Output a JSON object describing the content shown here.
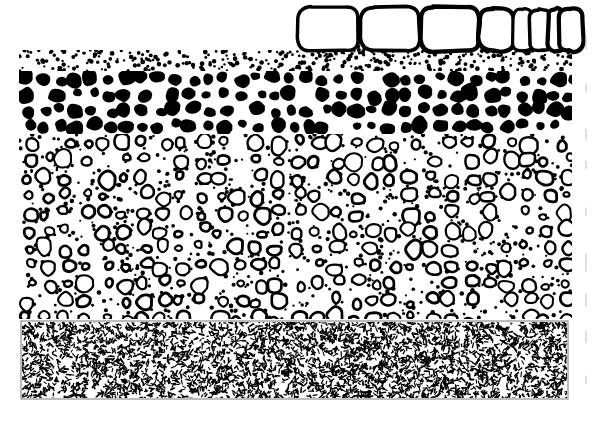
{
  "figure": {
    "background_color": "#ffffff",
    "ink_color": "#000000",
    "border_color": "#7a7a7a",
    "width": 597,
    "height": 422,
    "bounds": {
      "left": 19,
      "right": 572,
      "top": 5,
      "bottom": 399
    }
  },
  "layers": [
    {
      "id": "boulder-clast-row",
      "label": "Large outlined boulder clasts",
      "pattern": "outlined-boulders",
      "fill": "#ffffff",
      "stroke": "#000000",
      "x": 295,
      "y": 5,
      "width": 277,
      "height": 45,
      "clast_count": 8,
      "clasts": [
        {
          "cx": 328,
          "cy": 29,
          "rx": 30,
          "ry": 22,
          "corner": 13
        },
        {
          "cx": 390,
          "cy": 29,
          "rx": 29,
          "ry": 22,
          "corner": 13
        },
        {
          "cx": 450,
          "cy": 29,
          "rx": 29,
          "ry": 22,
          "corner": 12
        },
        {
          "cx": 497,
          "cy": 30,
          "rx": 18,
          "ry": 21,
          "corner": 14
        },
        {
          "cx": 523,
          "cy": 30,
          "rx": 10,
          "ry": 21,
          "corner": 9
        },
        {
          "cx": 541,
          "cy": 30,
          "rx": 11,
          "ry": 21,
          "corner": 9
        },
        {
          "cx": 556,
          "cy": 30,
          "rx": 8,
          "ry": 21,
          "corner": 7
        },
        {
          "cx": 571,
          "cy": 30,
          "rx": 12,
          "ry": 21,
          "corner": 10
        }
      ]
    },
    {
      "id": "upper-stipple-band",
      "label": "Upper fine stipple (sand) band",
      "pattern": "coarse-dots",
      "x": 19,
      "y": 50,
      "width": 553,
      "height": 21,
      "dot_radius_min": 1.1,
      "dot_radius_max": 2.4,
      "dot_count": 330
    },
    {
      "id": "black-cobble-layer",
      "label": "Solid black cobble / clast-supported conglomerate",
      "pattern": "solid-blobs",
      "fill": "#000000",
      "x": 19,
      "y": 71,
      "width": 553,
      "height": 63,
      "rows": 4,
      "blob_count": 190,
      "blob_radius_min": 4.5,
      "blob_radius_max": 9.5
    },
    {
      "id": "outlined-pebble-layer",
      "label": "Outlined pebble conglomerate with matrix dots",
      "pattern": "outlined-pebbles-with-dots",
      "fill": "#ffffff",
      "stroke": "#000000",
      "x": 19,
      "y": 134,
      "width": 553,
      "height": 185,
      "pebble_count": 470,
      "pebble_radius_min": 3.5,
      "pebble_radius_max": 9.0,
      "matrix_dot_count": 900
    },
    {
      "id": "basal-stipple-box",
      "label": "Basal dense stipple / dash texture (mudstone)",
      "pattern": "dense-dashes",
      "fill": "#ffffff",
      "stroke": "#7a7a7a",
      "x": 21,
      "y": 321,
      "width": 547,
      "height": 78,
      "dash_count": 4200,
      "dash_length_min": 1.5,
      "dash_length_max": 5.0
    }
  ],
  "edge_artifacts": {
    "label": "Faint scan edge marks at right margin",
    "x": 586,
    "marks": 9,
    "color": "#c9c9c9"
  }
}
